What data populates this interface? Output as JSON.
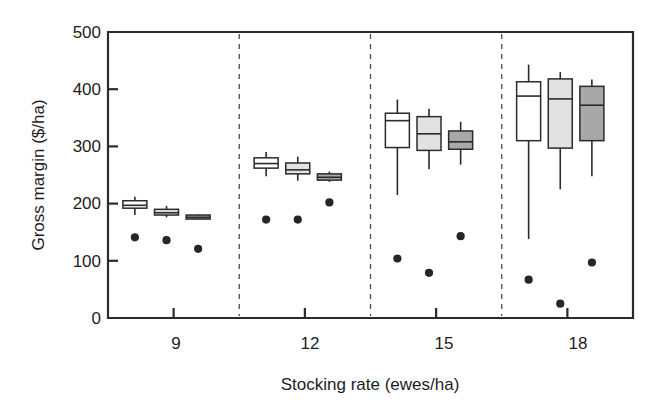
{
  "chart_data": {
    "type": "box",
    "title": "",
    "xlabel": "Stocking rate (ewes/ha)",
    "ylabel": "Gross margin ($/ha)",
    "ylim": [
      0,
      500
    ],
    "yticks": [
      0,
      100,
      200,
      300,
      400,
      500
    ],
    "yticklabels": [
      "0",
      "100",
      "200",
      "300",
      "400",
      "500"
    ],
    "categories": [
      "9",
      "12",
      "15",
      "18"
    ],
    "xticklabels": [
      "9",
      "12",
      "15",
      "18"
    ],
    "grid": false,
    "legend": "none",
    "group_separators": true,
    "series": [
      {
        "name": "series-1",
        "fill": "#ffffff",
        "boxes": [
          {
            "category": "9",
            "whisker_low": 180,
            "q1": 192,
            "median": 197,
            "q3": 205,
            "whisker_high": 212,
            "point": 141
          },
          {
            "category": "12",
            "whisker_low": 248,
            "q1": 262,
            "median": 270,
            "q3": 280,
            "whisker_high": 290,
            "point": 172
          },
          {
            "category": "15",
            "whisker_low": 215,
            "q1": 298,
            "median": 345,
            "q3": 358,
            "whisker_high": 382,
            "point": 104
          },
          {
            "category": "18",
            "whisker_low": 138,
            "q1": 310,
            "median": 388,
            "q3": 413,
            "whisker_high": 443,
            "point": 67
          }
        ]
      },
      {
        "name": "series-2",
        "fill": "#e2e2e2",
        "boxes": [
          {
            "category": "9",
            "whisker_low": 176,
            "q1": 180,
            "median": 184,
            "q3": 190,
            "whisker_high": 196,
            "point": 136
          },
          {
            "category": "12",
            "whisker_low": 240,
            "q1": 252,
            "median": 259,
            "q3": 271,
            "whisker_high": 282,
            "point": 172
          },
          {
            "category": "15",
            "whisker_low": 260,
            "q1": 293,
            "median": 322,
            "q3": 352,
            "whisker_high": 366,
            "point": 79
          },
          {
            "category": "18",
            "whisker_low": 225,
            "q1": 297,
            "median": 383,
            "q3": 418,
            "whisker_high": 430,
            "point": 25
          }
        ]
      },
      {
        "name": "series-3",
        "fill": "#a8a8a8",
        "boxes": [
          {
            "category": "9",
            "whisker_low": 172,
            "q1": 173,
            "median": 176,
            "q3": 180,
            "whisker_high": 181,
            "point": 121
          },
          {
            "category": "12",
            "whisker_low": 238,
            "q1": 241,
            "median": 246,
            "q3": 252,
            "whisker_high": 256,
            "point": 202
          },
          {
            "category": "15",
            "whisker_low": 268,
            "q1": 295,
            "median": 308,
            "q3": 327,
            "whisker_high": 343,
            "point": 143
          },
          {
            "category": "18",
            "whisker_low": 248,
            "q1": 310,
            "median": 372,
            "q3": 405,
            "whisker_high": 417,
            "point": 97
          }
        ]
      }
    ]
  },
  "axes": {
    "y_title": "Gross margin ($/ha)",
    "x_title": "Stocking rate (ewes/ha)",
    "y_tick_0": "0",
    "y_tick_100": "100",
    "y_tick_200": "200",
    "y_tick_300": "300",
    "y_tick_400": "400",
    "y_tick_500": "500",
    "x_tick_1": "9",
    "x_tick_2": "12",
    "x_tick_3": "15",
    "x_tick_4": "18"
  },
  "colors": {
    "axis": "#2b2b2b",
    "text": "#1d1d1d",
    "series_1_fill": "#ffffff",
    "series_2_fill": "#e2e2e2",
    "series_3_fill": "#a8a8a8",
    "separator": "#4a4a4a",
    "point": "#262626",
    "background": "#ffffff"
  }
}
